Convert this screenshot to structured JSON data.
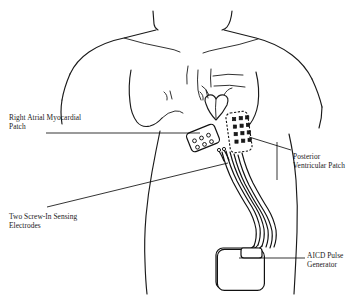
{
  "figure": {
    "style": "black-and-white anatomical line drawing",
    "background_color": "#ffffff",
    "line_color": "#1a1a1a"
  },
  "labels": {
    "right_atrial": "Right Atrial Myocardial\nPatch",
    "screw_in": "Two Screw-In Sensing\nElectrodes",
    "posterior": "Posterior\nVentricular Patch",
    "aicd": "AICD Pulse\nGenerator"
  },
  "components": {
    "right_atrial_patch": "right-atrial-myocardial-patch",
    "posterior_ventricular_patch": "posterior-ventricular-patch",
    "sensing_electrodes": "two-screw-in-sensing-electrodes",
    "pulse_generator": "aicd-pulse-generator",
    "lead_bundle": "lead-cable-bundle",
    "heart": "heart-outline"
  }
}
